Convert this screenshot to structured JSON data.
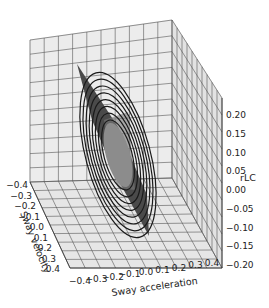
{
  "chart_data": {
    "type": "surface3d",
    "title": "",
    "xlabel": "Sway acceleration",
    "ylabel": "Sway velocity",
    "zlabel": "rLC",
    "x_ticks": [
      "-0.4",
      "-0.3",
      "-0.2",
      "-0.1",
      "0.0",
      "0.1",
      "0.2",
      "0.3",
      "0.4"
    ],
    "y_ticks": [
      "-0.4",
      "-0.3",
      "-0.2",
      "-0.1",
      "0.0",
      "0.1",
      "0.2",
      "0.3",
      "0.4"
    ],
    "z_ticks": [
      "0.20",
      "0.15",
      "0.10",
      "0.05",
      "0.00",
      "-0.05",
      "-0.10",
      "-0.15",
      "-0.20"
    ],
    "xlim": [
      -0.4,
      0.4
    ],
    "ylim": [
      -0.4,
      0.4
    ],
    "zlim": [
      -0.2,
      0.2
    ],
    "grid": true,
    "colors": {
      "surface": "#4a4a4a",
      "contour": "#1a1a1a",
      "center": "#8c8c8c",
      "pane": "#ebebeb",
      "grid": "#555555"
    }
  }
}
